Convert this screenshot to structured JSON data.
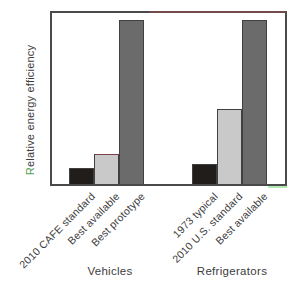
{
  "colors": {
    "background": "#ffffff",
    "frame": "#4a4a4a",
    "frame_top_red_tint": "#8a4a4a",
    "bar_outline": "#404040",
    "bar_black": "#201d1b",
    "bar_light_gray": "#c9c9c9",
    "bar_dark_gray": "#6b6b6b",
    "light_bar_top_tint": "#7c4046",
    "axis_text": "#3c3c3c",
    "ylabel_initial_green_tint": "#55a055",
    "green_artifact_line": "#b2e8b4"
  },
  "chart_data": {
    "type": "bar",
    "title": "",
    "xlabel": "",
    "ylabel": "Relative energy efficiency",
    "y_axis": {
      "tick_labels": [],
      "note": "unlabeled relative scale, no ticks or gridlines",
      "ylim": [
        0,
        107
      ]
    },
    "legend": "none",
    "grid": "off",
    "groups": [
      {
        "label": "Vehicles",
        "categories": [
          "2010 CAFE standard",
          "Best available",
          "Best prototype"
        ],
        "values": [
          10,
          18,
          100
        ],
        "bar_colors": [
          "#201d1b",
          "#c9c9c9",
          "#6b6b6b"
        ]
      },
      {
        "label": "Refrigerators",
        "categories": [
          "1973 typical",
          "2010 U.S. standard",
          "Best available"
        ],
        "values": [
          12,
          46,
          100
        ],
        "bar_colors": [
          "#201d1b",
          "#c9c9c9",
          "#6b6b6b"
        ]
      }
    ]
  }
}
